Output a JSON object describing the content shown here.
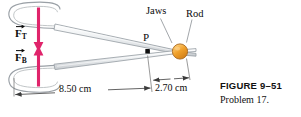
{
  "figure": {
    "labels": {
      "force_top_symbol": "F",
      "force_top_subscript": "T",
      "force_bottom_symbol": "F",
      "force_bottom_subscript": "B",
      "pivot": "P",
      "jaws": "Jaws",
      "rod": "Rod"
    },
    "dimensions": [
      {
        "name": "handle-to-pivot",
        "value": "8.50 cm"
      },
      {
        "name": "pivot-to-rod",
        "value": "2.70 cm"
      }
    ],
    "caption": {
      "title": "FIGURE 9–51",
      "subtitle": "Problem 17."
    },
    "colors": {
      "background": "#ffffff",
      "force_arrow": "#e0246b",
      "metal_fill": "#e9ecef",
      "metal_stroke": "#9aa0a6",
      "rod_fill": "#f0a02a",
      "rod_stroke": "#a8651a",
      "pivot": "#101010",
      "leader_line": "#8a8f94",
      "dimension_line": "#4a4a4a",
      "text": "#0b0b0b"
    }
  }
}
